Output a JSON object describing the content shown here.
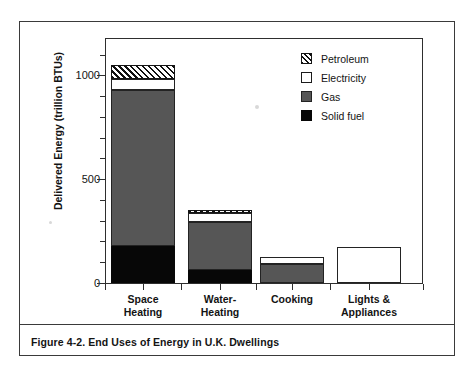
{
  "figure": {
    "caption": "Figure 4-2.  End Uses of Energy in U.K. Dwellings"
  },
  "chart_data": {
    "type": "bar",
    "subtype": "stacked",
    "title": "",
    "xlabel": "",
    "ylabel": "Delivered Energy (trillion BTUs)",
    "ylim": [
      0,
      1180
    ],
    "ytick_labels": [
      "0",
      "500",
      "1000"
    ],
    "yticks": [
      0,
      500,
      1000
    ],
    "yminor_step": 100,
    "grid": false,
    "legend_position": "top-right",
    "categories": [
      "Space Heating",
      "Water-Heating",
      "Cooking",
      "Lights & Appliances"
    ],
    "category_lines": [
      [
        "Space",
        "Heating"
      ],
      [
        "Water-",
        "Heating"
      ],
      [
        "Cooking",
        ""
      ],
      [
        "Lights &",
        "Appliances"
      ]
    ],
    "series": [
      {
        "name": "Solid fuel",
        "color": "#070707",
        "pattern": "solid-black",
        "values": [
          179,
          63,
          0,
          0
        ]
      },
      {
        "name": "Gas",
        "color": "#565656",
        "pattern": "solid-gray",
        "values": [
          750,
          232,
          90,
          0
        ]
      },
      {
        "name": "Electricity",
        "color": "#ffffff",
        "pattern": "open",
        "values": [
          55,
          42,
          35,
          175
        ]
      },
      {
        "name": "Petroleum",
        "color": "#111111",
        "pattern": "hatched",
        "values": [
          67,
          15,
          0,
          0
        ]
      }
    ],
    "totals": [
      1051,
      352,
      125,
      175
    ],
    "annotations": []
  },
  "legend": {
    "items": [
      {
        "label": "Petroleum",
        "swatch": "hatched-swatch"
      },
      {
        "label": "Electricity",
        "swatch": "open-swatch"
      },
      {
        "label": "Gas",
        "swatch": "gray-swatch"
      },
      {
        "label": "Solid fuel",
        "swatch": "black-swatch"
      }
    ]
  }
}
